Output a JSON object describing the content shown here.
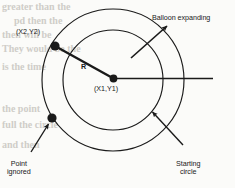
{
  "figure": {
    "type": "diagram",
    "background_color": "#fbfbf9",
    "ink_color": "#1a1a1a"
  },
  "geometry": {
    "center": {
      "x": 113,
      "y": 80
    },
    "outer_circle": {
      "radius": 71,
      "role": "expanded balloon"
    },
    "inner_circle": {
      "radius": 50,
      "role": "starting circle"
    },
    "center_point": {
      "x": 113.5,
      "y": 78.5
    },
    "point_x2y2": {
      "x": 55,
      "y": 46
    },
    "point_ignored": {
      "x": 52,
      "y": 118
    },
    "radius_line": {
      "x1": 55,
      "y1": 46,
      "x2": 113.5,
      "y2": 78.5
    },
    "horizontal_line": {
      "x1": 113.5,
      "y1": 78.5,
      "x2": 213,
      "y2": 78.5
    }
  },
  "labels": {
    "point_x2y2": "(X2,Y2)",
    "center": "(X1,Y1)",
    "radius": "R",
    "balloon_expanding": "Balloon expanding",
    "point_ignored_line1": "Point",
    "point_ignored_line2": "ignored",
    "starting_circle_line1": "Starting",
    "starting_circle_line2": "circle"
  },
  "arrows": {
    "balloon_expanding": {
      "from_x": 131,
      "from_y": 58,
      "to_x": 168,
      "to_y": 25
    },
    "point_ignored": {
      "from_x": 30,
      "from_y": 152,
      "to_x": 49,
      "to_y": 124
    },
    "starting_circle": {
      "from_x": 183,
      "from_y": 145,
      "to_x": 152,
      "to_y": 112
    }
  },
  "bleedthrough": {
    "note": "faint reverse-side text visible through the scanned page",
    "lines": [
      {
        "text": "greater than the",
        "x": 2,
        "y": 2,
        "size": 10
      },
      {
        "text": "pd then the",
        "x": 14,
        "y": 16,
        "size": 10
      },
      {
        "text": "then will be",
        "x": 2,
        "y": 30,
        "size": 10
      },
      {
        "text": "They would be the",
        "x": 2,
        "y": 44,
        "size": 10
      },
      {
        "text": "is the time",
        "x": 2,
        "y": 62,
        "size": 10
      },
      {
        "text": "the point",
        "x": 2,
        "y": 104,
        "size": 10
      },
      {
        "text": "full the circle",
        "x": 2,
        "y": 120,
        "size": 10
      },
      {
        "text": "and then",
        "x": 2,
        "y": 140,
        "size": 10
      }
    ]
  }
}
